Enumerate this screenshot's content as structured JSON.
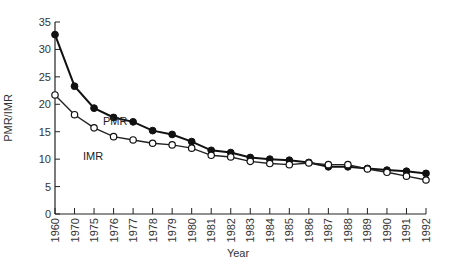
{
  "chart_data": {
    "type": "line",
    "title": "",
    "xlabel": "Year",
    "ylabel": "PMR/IMR",
    "ylim": [
      0,
      35
    ],
    "yticks": [
      0,
      5,
      10,
      15,
      20,
      25,
      30,
      35
    ],
    "grid": false,
    "legend": "inline labels",
    "categories": [
      "1960",
      "1970",
      "1975",
      "1976",
      "1977",
      "1978",
      "1979",
      "1980",
      "1981",
      "1982",
      "1983",
      "1984",
      "1985",
      "1986",
      "1987",
      "1988",
      "1989",
      "1990",
      "1991",
      "1992"
    ],
    "series": [
      {
        "name": "PMR",
        "marker": "filled-circle",
        "values": [
          32.7,
          23.3,
          19.3,
          17.6,
          16.8,
          15.2,
          14.5,
          13.2,
          11.6,
          11.2,
          10.3,
          10.0,
          9.8,
          9.4,
          8.6,
          8.6,
          8.3,
          8.0,
          7.8,
          7.4
        ]
      },
      {
        "name": "IMR",
        "marker": "open-circle",
        "values": [
          21.7,
          18.1,
          15.7,
          14.1,
          13.5,
          12.9,
          12.6,
          12.0,
          10.7,
          10.4,
          9.6,
          9.2,
          9.0,
          9.3,
          9.0,
          9.0,
          8.2,
          7.6,
          6.9,
          6.2
        ]
      }
    ],
    "annotations": [
      {
        "text": "PMR",
        "near": "1970-1975",
        "series": "PMR"
      },
      {
        "text": "IMR",
        "near": "1975-1976",
        "series": "IMR"
      }
    ]
  },
  "labels": {
    "xlabel": "Year",
    "ylabel": "PMR/IMR",
    "pmr": "PMR",
    "imr": "IMR"
  }
}
